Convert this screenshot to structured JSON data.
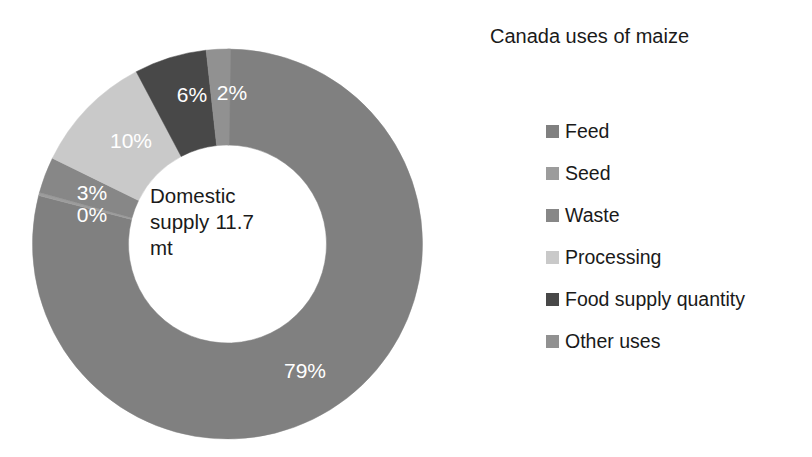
{
  "chart_data": {
    "type": "pie",
    "variant": "donut",
    "title": "Canada uses of maize",
    "center_label": "Domestic supply 11.7 mt",
    "center_label_lines": [
      "Domestic",
      "supply 11.7",
      "mt"
    ],
    "categories": [
      "Feed",
      "Seed",
      "Waste",
      "Processing",
      "Food supply quantity",
      "Other uses"
    ],
    "values": [
      79,
      0,
      3,
      10,
      6,
      2
    ],
    "value_labels": [
      "79%",
      "0%",
      "3%",
      "10%",
      "6%",
      "2%"
    ],
    "units": "percent",
    "colors": [
      "#808080",
      "#9c9c9c",
      "#878787",
      "#c9c9c9",
      "#484848",
      "#919191"
    ],
    "legend_position": "right",
    "grid": false,
    "xlabel": "",
    "ylabel": "",
    "slices": [
      {
        "name": "Feed",
        "value": 79,
        "label": "79%",
        "color": "#808080"
      },
      {
        "name": "Seed",
        "value": 0,
        "label": "0%",
        "color": "#9c9c9c"
      },
      {
        "name": "Waste",
        "value": 3,
        "label": "3%",
        "color": "#878787"
      },
      {
        "name": "Processing",
        "value": 10,
        "label": "10%",
        "color": "#c9c9c9"
      },
      {
        "name": "Food supply quantity",
        "value": 6,
        "label": "6%",
        "color": "#484848"
      },
      {
        "name": "Other uses",
        "value": 2,
        "label": "2%",
        "color": "#919191"
      }
    ]
  },
  "title": {
    "text": "Canada uses of maize"
  },
  "center": {
    "text": "Domestic supply 11.7 mt",
    "line1": "Domestic",
    "line2": "supply 11.7",
    "line3": "mt"
  },
  "legend": {
    "items": [
      {
        "label": "Feed",
        "color": "#808080"
      },
      {
        "label": "Seed",
        "color": "#9c9c9c"
      },
      {
        "label": "Waste",
        "color": "#878787"
      },
      {
        "label": "Processing",
        "color": "#c9c9c9"
      },
      {
        "label": "Food supply quantity",
        "color": "#484848"
      },
      {
        "label": "Other uses",
        "color": "#919191"
      }
    ]
  },
  "slice_labels": {
    "feed": "79%",
    "seed": "0%",
    "waste": "3%",
    "processing": "10%",
    "food_supply_quantity": "6%",
    "other_uses": "2%"
  }
}
